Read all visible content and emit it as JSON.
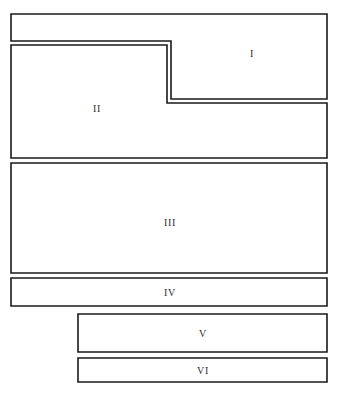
{
  "diagram": {
    "canvas": {
      "width": 349,
      "height": 395
    },
    "style": {
      "background_color": "#ffffff",
      "stroke_color": "#1a1a1a",
      "fill_color": "#ffffff",
      "label_color": "#2b2b2b",
      "stroke_width": 1.6
    },
    "units": [
      {
        "id": "unit-i",
        "label": "I",
        "shape": "l-shaped-polygon",
        "points": "11,14 327,14 327,99 171,99 171,41 11,41",
        "label_x": 252,
        "label_y": 53
      },
      {
        "id": "unit-ii",
        "label": "II",
        "shape": "step-polygon",
        "points": "11,45 167,45 167,103 327,103 327,158 11,158",
        "label_x": 97,
        "label_y": 108
      },
      {
        "id": "unit-iii",
        "label": "III",
        "shape": "rectangle",
        "points": "11,163 327,163 327,273 11,273",
        "label_x": 170,
        "label_y": 222
      },
      {
        "id": "unit-iv",
        "label": "IV",
        "shape": "rectangle",
        "points": "11,278 327,278 327,306 11,306",
        "label_x": 170,
        "label_y": 292
      },
      {
        "id": "unit-v",
        "label": "V",
        "shape": "rectangle",
        "points": "78,314 327,314 327,352 78,352",
        "label_x": 203,
        "label_y": 333
      },
      {
        "id": "unit-vi",
        "label": "VI",
        "shape": "rectangle",
        "points": "78,358 327,358 327,382 78,382",
        "label_x": 203,
        "label_y": 370
      }
    ]
  }
}
